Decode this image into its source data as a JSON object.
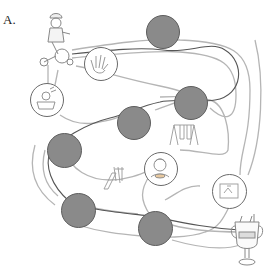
{
  "figure": {
    "label": "A."
  },
  "colors": {
    "filled_space": "#8a8a8a",
    "filled_border": "#5e5e5e",
    "path_outer": "#b5b5b5",
    "path_center": "#555555",
    "open_space_border": "#6a6a6a"
  },
  "start": {
    "name": "child-on-tricycle"
  },
  "finish": {
    "name": "trophy-cup"
  },
  "spaces": [
    {
      "id": 1,
      "type": "filled",
      "x": 163,
      "y": 32,
      "d": 34
    },
    {
      "id": 2,
      "type": "open",
      "picture": "hand",
      "x": 101,
      "y": 64,
      "d": 34
    },
    {
      "id": 3,
      "type": "open",
      "picture": "child-in-bath",
      "x": 47,
      "y": 83,
      "d": 34
    },
    {
      "id": 4,
      "type": "filled",
      "x": 191,
      "y": 86,
      "d": 34
    },
    {
      "id": 5,
      "type": "filled",
      "x": 117,
      "y": 106,
      "d": 34
    },
    {
      "id": 6,
      "type": "filled",
      "x": 47,
      "y": 134,
      "d": 35
    },
    {
      "id": 7,
      "type": "open",
      "picture": "child-eating",
      "x": 144,
      "y": 152,
      "d": 34
    },
    {
      "id": 8,
      "type": "open",
      "picture": "picture-frame",
      "x": 212,
      "y": 174,
      "d": 35
    },
    {
      "id": 9,
      "type": "filled",
      "x": 61,
      "y": 193,
      "d": 35
    },
    {
      "id": 10,
      "type": "filled",
      "x": 138,
      "y": 211,
      "d": 35
    }
  ],
  "decorations": [
    {
      "name": "swing-set",
      "x": 168,
      "y": 123
    },
    {
      "name": "slide",
      "x": 100,
      "y": 163
    }
  ]
}
